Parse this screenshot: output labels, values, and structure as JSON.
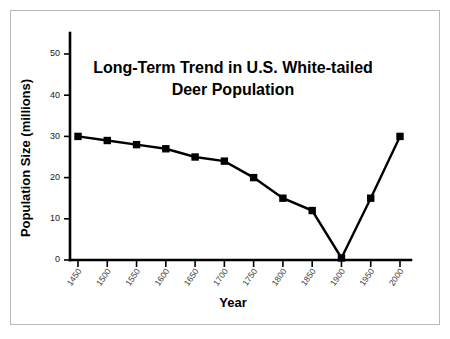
{
  "slide": {
    "background_color": "#ffffff",
    "frame_color": "#b9b9b9"
  },
  "chart_data": {
    "type": "line",
    "title": "Long-Term Trend in U.S. White-tailed Deer Population",
    "title_line_1": "Long-Term Trend in U.S. White-tailed",
    "title_line_2": "Deer Population",
    "xlabel": "Year",
    "ylabel": "Population Size (millions)",
    "categories": [
      "1450",
      "1500",
      "1550",
      "1600",
      "1650",
      "1700",
      "1750",
      "1800",
      "1850",
      "1900",
      "1950",
      "2000"
    ],
    "x": [
      1450,
      1500,
      1550,
      1600,
      1650,
      1700,
      1750,
      1800,
      1850,
      1900,
      1950,
      2000
    ],
    "values": [
      30,
      29,
      28,
      27,
      25,
      24,
      20,
      15,
      12,
      0.5,
      15,
      30
    ],
    "series": [
      {
        "name": "U.S. White-tailed Deer Population",
        "values": [
          30,
          29,
          28,
          27,
          25,
          24,
          20,
          15,
          12,
          0.5,
          15,
          30
        ],
        "color": "#000000",
        "marker": "square"
      }
    ],
    "xlim": [
      1450,
      2000
    ],
    "ylim": [
      0,
      55
    ],
    "yticks": [
      0,
      10,
      20,
      30,
      40,
      50
    ],
    "ytick_labels": [
      "0",
      "10",
      "20",
      "30",
      "40",
      "50"
    ],
    "xticks": [
      1450,
      1500,
      1550,
      1600,
      1650,
      1700,
      1750,
      1800,
      1850,
      1900,
      1950,
      2000
    ],
    "xtick_labels": [
      "1450",
      "1500",
      "1550",
      "1600",
      "1650",
      "1700",
      "1750",
      "1800",
      "1850",
      "1900",
      "1950",
      "2000"
    ],
    "grid": false,
    "legend": false,
    "legend_position": "none",
    "axis_color": "#000000",
    "line_color": "#000000"
  }
}
